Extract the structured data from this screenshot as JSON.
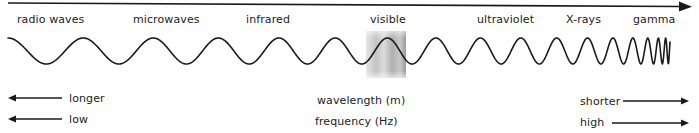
{
  "diagram": {
    "bands": [
      {
        "label": "radio waves",
        "x": 17
      },
      {
        "label": "microwaves",
        "x": 133
      },
      {
        "label": "infrared",
        "x": 246
      },
      {
        "label": "visible",
        "x": 370
      },
      {
        "label": "ultraviolet",
        "x": 477
      },
      {
        "label": "X-rays",
        "x": 566
      },
      {
        "label": "gamma",
        "x": 633
      }
    ],
    "axis": {
      "wavelength_label": "wavelength (m)",
      "frequency_label": "frequency (Hz)",
      "wavelength_left": "longer",
      "wavelength_right": "shorter",
      "frequency_left": "low",
      "frequency_right": "high"
    },
    "colors": {
      "ink": "#1a1a1a",
      "visible_band_light": "#e8e8e8",
      "visible_band_dark": "#a8a8a8"
    }
  }
}
